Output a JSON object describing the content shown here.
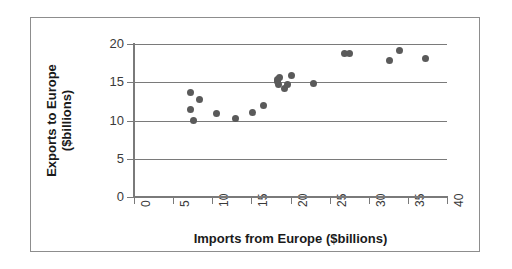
{
  "chart_data": {
    "type": "scatter",
    "title": "",
    "xlabel": "Imports from Europe ($billions)",
    "ylabel_line1": "Exports to Europe",
    "ylabel_line2": "($billions)",
    "ylabel": "Exports to Europe ($billions)",
    "xlim": [
      0,
      40
    ],
    "ylim": [
      0,
      20
    ],
    "xticks": [
      0,
      5,
      10,
      15,
      20,
      25,
      30,
      35,
      40
    ],
    "yticks": [
      0,
      5,
      10,
      15,
      20
    ],
    "xtick_labels": [
      "0",
      "5",
      "10",
      "15",
      "20",
      "25",
      "30",
      "35",
      "40"
    ],
    "ytick_labels": [
      "0",
      "5",
      "10",
      "15",
      "20"
    ],
    "grid": "horizontal",
    "legend": "none",
    "marker_color": "#5a5a5a",
    "axis_color": "#7a7a7a",
    "frame_color": "#8d8d8d",
    "background": "#ffffff",
    "points": [
      {
        "x": 7.2,
        "y": 13.6
      },
      {
        "x": 7.2,
        "y": 11.5
      },
      {
        "x": 7.6,
        "y": 10.0
      },
      {
        "x": 8.4,
        "y": 12.8
      },
      {
        "x": 10.5,
        "y": 10.9
      },
      {
        "x": 13.0,
        "y": 10.2
      },
      {
        "x": 15.2,
        "y": 11.0
      },
      {
        "x": 16.5,
        "y": 11.9
      },
      {
        "x": 18.3,
        "y": 15.4
      },
      {
        "x": 18.4,
        "y": 15.1
      },
      {
        "x": 18.5,
        "y": 14.7
      },
      {
        "x": 18.6,
        "y": 15.6
      },
      {
        "x": 19.2,
        "y": 14.2
      },
      {
        "x": 19.6,
        "y": 14.7
      },
      {
        "x": 20.1,
        "y": 15.9
      },
      {
        "x": 23.0,
        "y": 14.9
      },
      {
        "x": 26.9,
        "y": 18.8
      },
      {
        "x": 27.6,
        "y": 18.7
      },
      {
        "x": 32.7,
        "y": 17.9
      },
      {
        "x": 33.9,
        "y": 19.2
      },
      {
        "x": 37.3,
        "y": 18.1
      }
    ]
  }
}
